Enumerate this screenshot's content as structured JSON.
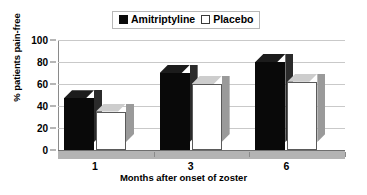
{
  "chart_data": {
    "type": "bar",
    "title": "",
    "xlabel": "Months after onset of zoster",
    "ylabel": "% patients pain-free",
    "categories": [
      "1",
      "3",
      "6"
    ],
    "series": [
      {
        "name": "Amitriptyline",
        "values": [
          47,
          70,
          80
        ],
        "color": "#090909"
      },
      {
        "name": "Placebo",
        "values": [
          35,
          60,
          62
        ],
        "color": "#ffffff"
      }
    ],
    "ylim": [
      0,
      100
    ],
    "yticks": [
      0,
      20,
      40,
      60,
      80,
      100
    ],
    "ytick_labels": [
      "0",
      "20",
      "40",
      "60",
      "80",
      "100"
    ],
    "grid": true,
    "legend_position": "top-center",
    "style": "3d-column"
  },
  "legend": {
    "entries": [
      {
        "label": "Amitriptyline",
        "marker": "filled-square"
      },
      {
        "label": "Placebo",
        "marker": "open-square"
      }
    ]
  },
  "axes": {
    "y_title": "% patients pain-free",
    "x_title": "Months after onset of zoster"
  }
}
